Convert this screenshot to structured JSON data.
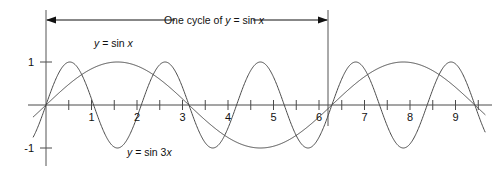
{
  "figure": {
    "title": "",
    "cycle_annotation": {
      "prefix": "One cycle of ",
      "var_y": "y",
      "equals": " = sin ",
      "var_x": "x",
      "full_text": "One cycle of y = sin x",
      "left_bound_x": 0,
      "right_bound_x": 6.2832
    },
    "curve_labels": {
      "sin_x": {
        "var_y": "y",
        "equals": " = sin ",
        "var_x": "x",
        "full_text": "y = sin x"
      },
      "sin_3x": {
        "var_y": "y",
        "equals": " = sin 3",
        "var_x": "x",
        "full_text": "y = sin 3x"
      }
    },
    "y_axis": {
      "tick_labels": [
        "1",
        "-1"
      ],
      "tick_values": [
        1,
        -1
      ]
    },
    "x_axis": {
      "tick_labels": [
        "1",
        "2",
        "3",
        "4",
        "5",
        "6",
        "7",
        "8",
        "9"
      ],
      "tick_values": [
        1,
        2,
        3,
        4,
        5,
        6,
        7,
        8,
        9
      ],
      "minor_tick_step": 0.5
    },
    "colors": {
      "curve": "#4a4a4a",
      "axis": "#4a4a4a",
      "text": "#111111",
      "background": "#ffffff"
    }
  },
  "chart_data": {
    "type": "line",
    "title": "",
    "xlabel": "",
    "ylabel": "",
    "xlim": [
      -0.28,
      9.65
    ],
    "ylim": [
      -1.35,
      1.35
    ],
    "grid": false,
    "legend": "inline-annotations",
    "x_ticks": [
      1,
      2,
      3,
      4,
      5,
      6,
      7,
      8,
      9
    ],
    "x_minor_ticks": [
      0.5,
      1.5,
      2.5,
      3.5,
      4.5,
      5.5,
      6.5,
      7.5,
      8.5,
      9.5
    ],
    "y_ticks": [
      -1,
      1
    ],
    "annotations": [
      {
        "text": "One cycle of y = sin x",
        "x_start": 0,
        "x_end": 6.2832,
        "y": 1.95,
        "style": "double-arrow"
      },
      {
        "text": "y = sin x",
        "x": 1.35,
        "y": 1.45
      },
      {
        "text": "y = sin 3x",
        "x": 2.35,
        "y": -1.1
      }
    ],
    "series": [
      {
        "name": "y = sin x",
        "formula": "sin(x)",
        "amplitude": 1,
        "period": 6.2832,
        "zeros": [
          0,
          3.1416,
          6.2832,
          9.4248
        ],
        "maxima_x": [
          1.5708,
          7.854
        ],
        "minima_x": [
          4.7124
        ]
      },
      {
        "name": "y = sin 3x",
        "formula": "sin(3x)",
        "amplitude": 1,
        "period": 2.0944,
        "zeros": [
          0,
          1.0472,
          2.0944,
          3.1416,
          4.1888,
          5.236,
          6.2832,
          7.3304,
          8.3776,
          9.4248
        ],
        "maxima_x": [
          0.5236,
          2.618,
          4.7124,
          6.8068,
          8.9012
        ],
        "minima_x": [
          1.5708,
          3.6652,
          5.7596,
          7.854
        ]
      }
    ]
  }
}
